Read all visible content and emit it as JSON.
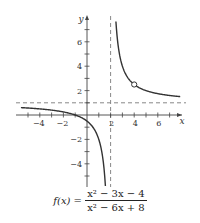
{
  "chart_data": {
    "type": "line",
    "title": "",
    "function_label": "f(x) =",
    "numerator": "x² − 3x − 4",
    "denominator": "x² − 6x + 8",
    "xlabel": "x",
    "ylabel": "y",
    "xlim": [
      -5.5,
      8
    ],
    "ylim": [
      -5.5,
      7.2
    ],
    "x_ticks": [
      -4,
      -2,
      2,
      4,
      6
    ],
    "y_ticks": [
      -4,
      -2,
      2,
      4,
      6
    ],
    "x_tick_labels": [
      "−4",
      "−2",
      "2",
      "4",
      "6"
    ],
    "y_tick_labels": [
      "−4",
      "−2",
      "2",
      "4",
      "6"
    ],
    "asymptotes": {
      "vertical": 2,
      "horizontal": 1
    },
    "hole": {
      "x": 4,
      "y": 2.5
    },
    "grid": false,
    "series": [
      {
        "name": "left branch",
        "x": [
          -5.5,
          -4,
          -3,
          -2,
          -1,
          0,
          0.5,
          1,
          1.3,
          1.5,
          1.55
        ],
        "y": [
          0.6,
          0.5,
          0.4,
          0.25,
          0,
          -0.5,
          -1,
          -2,
          -3.29,
          -5,
          -5.5
        ]
      },
      {
        "name": "right branch",
        "x": [
          2.45,
          2.5,
          2.75,
          3,
          3.5,
          4,
          5,
          6,
          7,
          7.8
        ],
        "y": [
          7.67,
          7,
          5,
          4,
          3,
          2.5,
          2,
          1.75,
          1.6,
          1.52
        ]
      }
    ]
  },
  "colors": {
    "curve": "#333333",
    "axis": "#444444",
    "asymptote": "#888888"
  }
}
